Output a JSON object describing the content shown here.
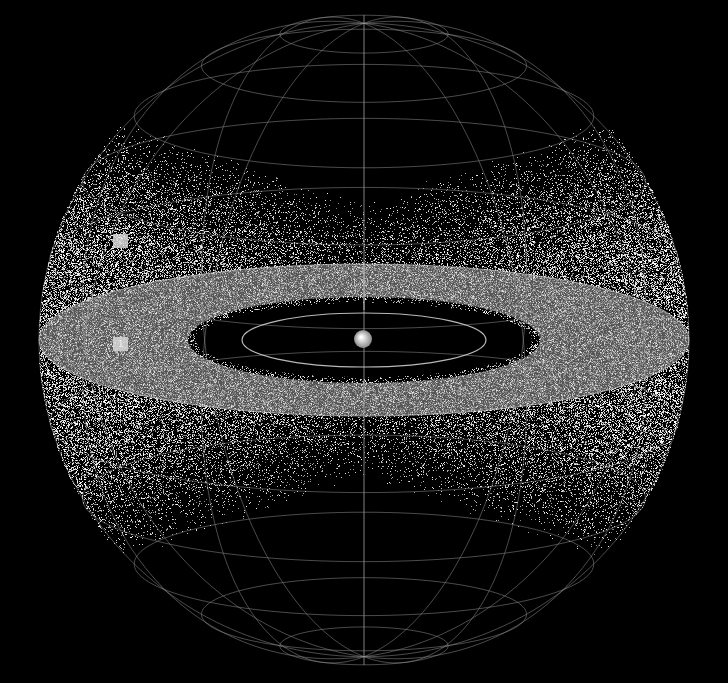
{
  "diagram": {
    "title": "",
    "background": "#000000",
    "sphere": {
      "cx": 364,
      "cy": 340,
      "r": 325,
      "tilt_deg": 13,
      "grid_color": "#9a9a9a",
      "meridians": 12,
      "parallels": [
        -75,
        -60,
        -45,
        -30,
        -15,
        15,
        30,
        45,
        60,
        75
      ]
    },
    "central_body": {
      "cx": 363,
      "cy": 339,
      "r": 9,
      "color": "#d0d0d0"
    },
    "inner_orbit": {
      "rx": 122,
      "ry": 27
    },
    "band": {
      "rx": 325,
      "ry": 76,
      "inner_rx": 176,
      "inner_ry": 43,
      "color": "#bdbdbd"
    },
    "markers": [
      {
        "label": "2",
        "x": 113,
        "y": 234
      },
      {
        "label": "1",
        "x": 113,
        "y": 337
      }
    ]
  }
}
